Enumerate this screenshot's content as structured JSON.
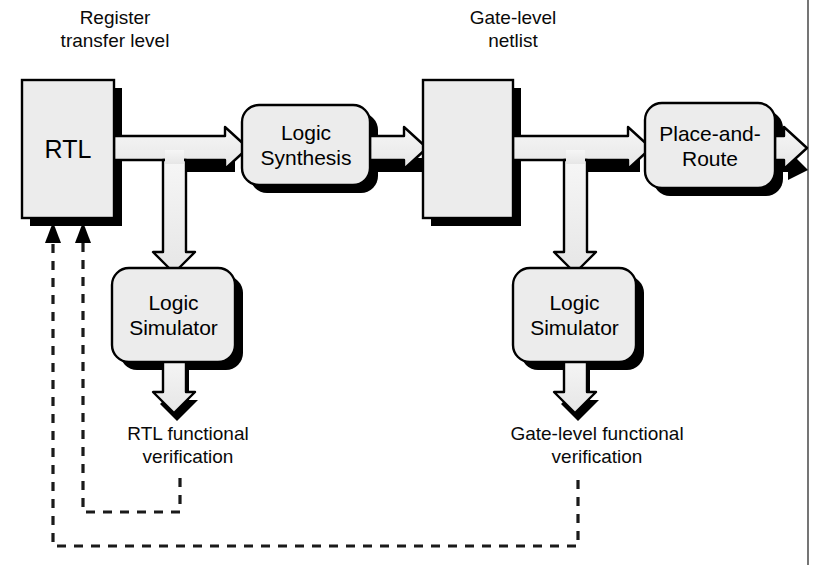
{
  "diagram": {
    "colors": {
      "box_fill": "#ececec",
      "box_stroke": "#000000",
      "shadow": "#000000",
      "band_fill": "#efefef",
      "dashed": "#1a1a1a",
      "frame": "#3b3b3b"
    },
    "labels": [
      {
        "id": "rtl-caption",
        "text": "Register\ntransfer level",
        "x": 20,
        "y": 6,
        "w": 190
      },
      {
        "id": "gate-caption",
        "text": "Gate-level\nnetlist",
        "x": 418,
        "y": 6,
        "w": 190
      },
      {
        "id": "rtl-verif",
        "text": "RTL functional\nverification",
        "x": 93,
        "y": 422,
        "w": 190
      },
      {
        "id": "gate-verif",
        "text": "Gate-level functional\nverification",
        "x": 472,
        "y": 422,
        "w": 250
      }
    ],
    "blocks": [
      {
        "id": "rtl",
        "kind": "rect",
        "text": "RTL",
        "x": 22,
        "y": 80,
        "w": 92,
        "h": 138
      },
      {
        "id": "logic-synth",
        "kind": "round",
        "text": "Logic\nSynthesis",
        "x": 242,
        "y": 105,
        "w": 128,
        "h": 80
      },
      {
        "id": "gate-netlist",
        "kind": "rect",
        "text": "",
        "x": 423,
        "y": 80,
        "w": 90,
        "h": 138
      },
      {
        "id": "place-route",
        "kind": "round",
        "text": "Place-and-\nRoute",
        "x": 645,
        "y": 103,
        "w": 130,
        "h": 85
      },
      {
        "id": "sim-rtl",
        "kind": "round",
        "text": "Logic\nSimulator",
        "x": 112,
        "y": 268,
        "w": 123,
        "h": 94
      },
      {
        "id": "sim-gate",
        "kind": "round",
        "text": "Logic\nSimulator",
        "x": 513,
        "y": 268,
        "w": 123,
        "h": 94
      }
    ],
    "flows": [
      {
        "id": "rtl-to-synthesis",
        "from": "rtl",
        "to": "logic-synth",
        "direction": "right"
      },
      {
        "id": "synthesis-to-netlist",
        "from": "logic-synth",
        "to": "gate-netlist",
        "direction": "right"
      },
      {
        "id": "netlist-to-place-route",
        "from": "gate-netlist",
        "to": "place-route",
        "direction": "right"
      },
      {
        "id": "place-route-output",
        "from": "place-route",
        "to": "output",
        "direction": "right"
      },
      {
        "id": "rtl-to-sim",
        "from": "rtl",
        "to": "sim-rtl",
        "direction": "down"
      },
      {
        "id": "netlist-to-sim",
        "from": "gate-netlist",
        "to": "sim-gate",
        "direction": "down"
      },
      {
        "id": "sim-rtl-to-verif",
        "from": "sim-rtl",
        "to": "rtl-verif",
        "direction": "down"
      },
      {
        "id": "sim-gate-to-verif",
        "from": "sim-gate",
        "to": "gate-verif",
        "direction": "down"
      }
    ],
    "feedback": [
      {
        "id": "rtl-functional-feedback",
        "from": "rtl-verif",
        "to": "rtl",
        "style": "dashed"
      },
      {
        "id": "gate-functional-feedback",
        "from": "gate-verif",
        "to": "rtl",
        "style": "dashed"
      }
    ]
  }
}
